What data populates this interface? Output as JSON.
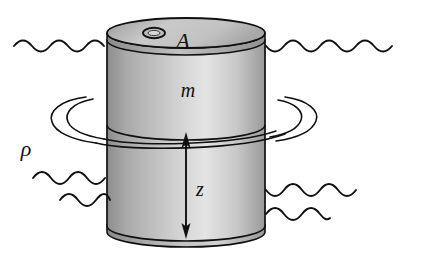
{
  "figure": {
    "type": "physics-diagram",
    "width": 421,
    "height": 261,
    "background_color": "#ffffff",
    "line_color": "#101010"
  },
  "labels": {
    "area": "A",
    "mass": "m",
    "depth": "z",
    "density": "ρ"
  },
  "label_positions": {
    "area": {
      "x": 183,
      "y": 48
    },
    "mass": {
      "x": 188,
      "y": 97
    },
    "depth": {
      "x": 196,
      "y": 194
    },
    "density": {
      "x": 26,
      "y": 154
    }
  },
  "cylinder": {
    "name": "cylinder-body",
    "left": 107,
    "right": 265,
    "top_cap_center_y": 40,
    "bottom_cap_center_y": 232,
    "cap_rx": 79,
    "cap_ry": 15,
    "rim_offset": 6,
    "fill_gradient": [
      {
        "stop": 0.0,
        "color": "#8c8c8c"
      },
      {
        "stop": 0.12,
        "color": "#a9a9a9"
      },
      {
        "stop": 0.42,
        "color": "#cfcfcf"
      },
      {
        "stop": 0.62,
        "color": "#e2e2e2"
      },
      {
        "stop": 0.82,
        "color": "#c8c8c8"
      },
      {
        "stop": 1.0,
        "color": "#9a9a9a"
      }
    ],
    "top_cap_gradient": [
      {
        "stop": 0.0,
        "color": "#9c9c9c"
      },
      {
        "stop": 0.45,
        "color": "#c9c9c9"
      },
      {
        "stop": 1.0,
        "color": "#b0b0b0"
      }
    ],
    "hole": {
      "name": "cylinder-top-hole",
      "cx": 154,
      "cy": 40,
      "rx": 11,
      "ry": 5.5
    }
  },
  "waterline": {
    "name": "water-surface-level",
    "y": 42,
    "left_segment": {
      "x_start": 14,
      "x_end": 108,
      "amplitude": 5,
      "periods": 5
    },
    "right_segment": {
      "x_start": 265,
      "x_end": 398,
      "amplitude": 5,
      "periods": 7
    }
  },
  "swirl": {
    "name": "rotational-flow-swirl",
    "center_x": 186,
    "center_y": 120,
    "outer_rx": 118,
    "outer_ry": 26,
    "inner_rx": 96,
    "inner_ry": 20,
    "cylinder_waterline_y": 131
  },
  "depth_arrow": {
    "name": "depth-arrow-z",
    "x": 186,
    "y_top": 139,
    "y_bottom": 232,
    "double_headed": true
  },
  "wave_marks": [
    {
      "name": "wave-left-lower-1",
      "x_start": 33,
      "x_end": 108,
      "y": 174,
      "amplitude": 5,
      "periods": 4
    },
    {
      "name": "wave-left-lower-2",
      "x_start": 60,
      "x_end": 108,
      "y": 196,
      "amplitude": 5,
      "periods": 2.5
    },
    {
      "name": "wave-right-lower-1",
      "x_start": 266,
      "x_end": 360,
      "y": 188,
      "amplitude": 5,
      "periods": 5
    },
    {
      "name": "wave-right-lower-2",
      "x_start": 266,
      "x_end": 330,
      "y": 212,
      "amplitude": 5,
      "periods": 3.5
    }
  ]
}
